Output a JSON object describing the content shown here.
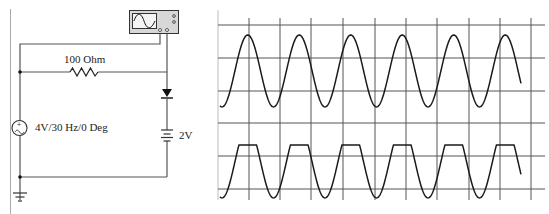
{
  "circuit": {
    "resistor_label": "100 Ohm",
    "source_label": "4V/30 Hz/0 Deg",
    "battery_label": "2V",
    "components": [
      {
        "type": "ac-voltage-source",
        "amplitude": "4V",
        "frequency": "30 Hz",
        "phase": "0 Deg"
      },
      {
        "type": "resistor",
        "value": "100 Ohm"
      },
      {
        "type": "diode"
      },
      {
        "type": "dc-battery",
        "value": "2V"
      },
      {
        "type": "oscilloscope"
      },
      {
        "type": "ground"
      }
    ]
  },
  "scope": {
    "grid": {
      "x_lines": [
        218,
        249,
        280,
        311,
        343,
        375,
        406,
        437,
        469,
        500,
        531
      ],
      "y_lines": [
        25,
        58,
        91,
        123,
        156,
        189
      ]
    },
    "trace_top": {
      "name": "input sine",
      "center_y": 71,
      "amplitude_px": 36,
      "period_px": 51.5,
      "start_x": 220,
      "end_x": 521
    },
    "trace_bottom": {
      "name": "clipped output",
      "base_center_y": 162,
      "amplitude_px": 36,
      "clip_y": 145,
      "period_px": 51.5,
      "start_x": 220,
      "end_x": 521
    }
  }
}
